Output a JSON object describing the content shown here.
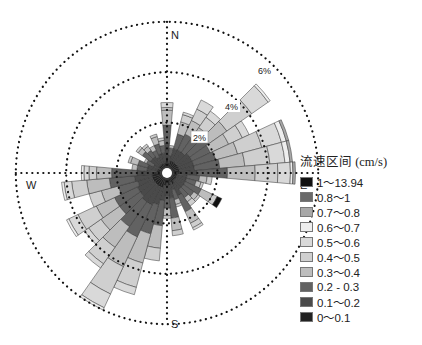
{
  "chart_data": {
    "type": "rose",
    "title": "",
    "direction_labels": {
      "N": "N",
      "E": "E",
      "S": "S",
      "W": "W"
    },
    "radial_axis": {
      "ticks": [
        "2%",
        "4%",
        "6%"
      ],
      "tick_values": [
        2,
        4,
        6
      ],
      "max": 6,
      "grid": "dotted circles"
    },
    "legend": {
      "title": "流速区间 (cm/s)",
      "position": "right",
      "entries": [
        {
          "label": "1～13.94",
          "color": "#111111"
        },
        {
          "label": "0.8～1",
          "color": "#6a6a6a"
        },
        {
          "label": "0.7～0.8",
          "color": "#a8a8a8"
        },
        {
          "label": "0.6～0.7",
          "color": "#eeeeee"
        },
        {
          "label": "0.5～0.6",
          "color": "#d9d9d9"
        },
        {
          "label": "0.4～0.5",
          "color": "#cfcfcf"
        },
        {
          "label": "0.3～0.4",
          "color": "#bdbdbd"
        },
        {
          "label": "0.2 - 0.3",
          "color": "#626262"
        },
        {
          "label": "0.1～0.2",
          "color": "#4a4a4a"
        },
        {
          "label": "0～0.1",
          "color": "#222222"
        }
      ]
    },
    "sector_width_deg": 10,
    "directions_deg": [
      0,
      10,
      20,
      30,
      40,
      50,
      60,
      70,
      80,
      90,
      100,
      110,
      120,
      130,
      140,
      150,
      160,
      170,
      180,
      190,
      200,
      210,
      220,
      230,
      240,
      250,
      260,
      270,
      280,
      290,
      300,
      310,
      320,
      330,
      340,
      350
    ],
    "stack_order": [
      "0～0.1",
      "0.1～0.2",
      "0.2 - 0.3",
      "0.3～0.4",
      "0.4～0.5",
      "0.5～0.6",
      "0.6～0.7",
      "0.7～0.8",
      "0.8～1",
      "1～13.94"
    ],
    "series_percent": [
      [
        0.6,
        0.6,
        0.7,
        0.6,
        0.1,
        0.2,
        0,
        0,
        0,
        0
      ],
      [
        0.4,
        0.3,
        0.3,
        0.1,
        0,
        0,
        0,
        0,
        0,
        0
      ],
      [
        0.5,
        0.5,
        0.6,
        0.5,
        0.3,
        0.1,
        0,
        0,
        0,
        0
      ],
      [
        0.5,
        0.5,
        0.7,
        0.6,
        0.5,
        0.4,
        0,
        0,
        0,
        0
      ],
      [
        0.5,
        0.5,
        0.7,
        0.5,
        0.5,
        0.3,
        0,
        0,
        0,
        0
      ],
      [
        0.5,
        0.6,
        0.9,
        0.9,
        1.2,
        0.8,
        0.1,
        0,
        0,
        0
      ],
      [
        0.5,
        0.6,
        0.8,
        0.8,
        0.6,
        0.3,
        0,
        0,
        0,
        0
      ],
      [
        0.5,
        0.6,
        0.9,
        0.9,
        1.0,
        0.8,
        0.2,
        0.1,
        0,
        0
      ],
      [
        0.5,
        0.6,
        1.0,
        1.0,
        1.0,
        0.6,
        0.2,
        0.1,
        0,
        0
      ],
      [
        0.5,
        0.7,
        1.2,
        1.1,
        0.9,
        0.5,
        0.1,
        0.1,
        0,
        0
      ],
      [
        0.4,
        0.4,
        0.5,
        0.3,
        0.2,
        0,
        0,
        0,
        0,
        0
      ],
      [
        0.4,
        0.4,
        0.4,
        0.2,
        0.1,
        0,
        0,
        0,
        0,
        0
      ],
      [
        0.4,
        0.4,
        0.7,
        0.5,
        0.2,
        0,
        0,
        0,
        0,
        0.2
      ],
      [
        0.4,
        0.4,
        0.5,
        0.2,
        0.1,
        0,
        0,
        0,
        0,
        0
      ],
      [
        0.4,
        0.4,
        0.4,
        0.2,
        0.2,
        0,
        0,
        0,
        0,
        0
      ],
      [
        0.5,
        0.5,
        0.7,
        0.5,
        0.2,
        0.1,
        0,
        0,
        0,
        0
      ],
      [
        0.4,
        0.3,
        0.4,
        0.2,
        0.1,
        0,
        0,
        0,
        0,
        0
      ],
      [
        0.5,
        0.5,
        0.8,
        0.5,
        0.2,
        0,
        0,
        0,
        0,
        0
      ],
      [
        0.4,
        0.5,
        0.5,
        0.3,
        0.1,
        0,
        0,
        0,
        0,
        0
      ],
      [
        0.5,
        0.6,
        1.0,
        0.9,
        0.5,
        0,
        0,
        0,
        0,
        0
      ],
      [
        0.6,
        0.7,
        1.2,
        1.2,
        1.0,
        0.3,
        0,
        0,
        0,
        0
      ],
      [
        0.6,
        0.8,
        1.4,
        1.3,
        1.2,
        0.6,
        0.1,
        0,
        0,
        0
      ],
      [
        0.6,
        0.8,
        1.2,
        1.0,
        0.8,
        0.2,
        0,
        0,
        0,
        0
      ],
      [
        0.6,
        0.7,
        1.0,
        0.9,
        0.6,
        0.2,
        0,
        0,
        0,
        0
      ],
      [
        0.6,
        0.7,
        1.0,
        0.8,
        0.8,
        0.4,
        0.1,
        0,
        0,
        0
      ],
      [
        0.6,
        0.6,
        0.8,
        0.7,
        0.5,
        0,
        0,
        0,
        0,
        0
      ],
      [
        0.6,
        0.7,
        1.0,
        0.9,
        0.6,
        0.3,
        0.1,
        0,
        0,
        0
      ],
      [
        0.5,
        0.7,
        1.0,
        0.6,
        0.3,
        0.2,
        0.1,
        0,
        0,
        0
      ],
      [
        0.4,
        0.4,
        0.4,
        0.2,
        0,
        0,
        0,
        0,
        0,
        0
      ],
      [
        0.4,
        0.4,
        0.4,
        0.3,
        0.1,
        0,
        0,
        0,
        0,
        0
      ],
      [
        0.3,
        0.3,
        0.3,
        0.1,
        0,
        0,
        0,
        0,
        0,
        0
      ],
      [
        0.4,
        0.4,
        0.4,
        0.2,
        0.1,
        0,
        0,
        0,
        0,
        0
      ],
      [
        0.4,
        0.4,
        0.3,
        0.2,
        0.1,
        0,
        0,
        0,
        0,
        0
      ],
      [
        0.4,
        0.3,
        0.3,
        0.2,
        0,
        0,
        0,
        0,
        0,
        0
      ],
      [
        0.4,
        0.4,
        0.4,
        0.3,
        0.1,
        0,
        0,
        0,
        0,
        0
      ],
      [
        0.4,
        0.4,
        0.3,
        0.2,
        0.1,
        0,
        0,
        0,
        0,
        0
      ]
    ]
  },
  "legend": {
    "title": "流速区间 (cm/s)",
    "items": [
      {
        "label": "1～13.94",
        "color": "#111111"
      },
      {
        "label": "0.8～1",
        "color": "#6a6a6a"
      },
      {
        "label": "0.7～0.8",
        "color": "#a8a8a8"
      },
      {
        "label": "0.6～0.7",
        "color": "#eeeeee"
      },
      {
        "label": "0.5～0.6",
        "color": "#d9d9d9"
      },
      {
        "label": "0.4～0.5",
        "color": "#cfcfcf"
      },
      {
        "label": "0.3～0.4",
        "color": "#bdbdbd"
      },
      {
        "label": "0.2 - 0.3",
        "color": "#626262"
      },
      {
        "label": "0.1～0.2",
        "color": "#4a4a4a"
      },
      {
        "label": "0～0.1",
        "color": "#222222"
      }
    ]
  },
  "axes": {
    "north": "N",
    "east": "E",
    "south": "S",
    "west": "W",
    "ring_labels": [
      "2%",
      "4%",
      "6%"
    ]
  }
}
